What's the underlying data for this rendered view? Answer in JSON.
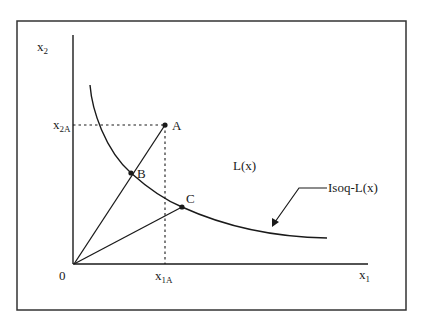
{
  "diagram": {
    "type": "isoquant",
    "axes": {
      "x_label": "x",
      "x_label_sub": "1",
      "y_label": "x",
      "y_label_sub": "2",
      "origin_label": "0"
    },
    "ticks": {
      "x_tick_label": "x",
      "x_tick_sub": "1A",
      "y_tick_label": "x",
      "y_tick_sub": "2A"
    },
    "points": [
      {
        "id": "A",
        "label": "A"
      },
      {
        "id": "B",
        "label": "B"
      },
      {
        "id": "C",
        "label": "C"
      }
    ],
    "region_label": "L(x)",
    "curve_label": "Isoq-L(x)",
    "colors": {
      "line": "#1a1a1a",
      "frame": "#333333",
      "background": "#ffffff"
    }
  }
}
